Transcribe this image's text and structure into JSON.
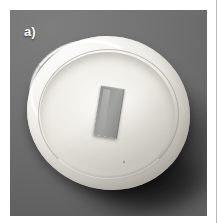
{
  "figure": {
    "panel_label": "a)",
    "caption": "",
    "background_color": "#6f6f6f",
    "label_color": "#ffffff"
  },
  "photo": {
    "subject": "white ceramic evaporating dish containing a rectangular test coupon",
    "view": "top-down slightly oblique",
    "color_mode": "grayscale",
    "elements": [
      {
        "name": "backdrop",
        "description": "uniform mid-grey studio backdrop darkening toward the lower right",
        "color": "#6f6f6f"
      },
      {
        "name": "cast-shadow",
        "description": "soft dark shadow cast down and to the right of the dish",
        "color": "#3a3a3a"
      },
      {
        "name": "ceramic-dish",
        "description": "round white glazed ceramic dish with raised rim and shallow basin",
        "color": "#f2f0ea"
      },
      {
        "name": "dish-rim-highlight",
        "description": "bright specular highlight along the upper-left rim",
        "color": "#ffffff"
      },
      {
        "name": "specimen-coupon",
        "description": "grey rectangular sample coupon resting in the centre of the basin, tilted clockwise",
        "color": "#9a9a98"
      }
    ]
  }
}
